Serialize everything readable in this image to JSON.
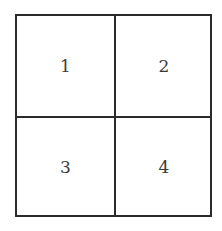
{
  "diagram": {
    "type": "2x2 grid",
    "cells": [
      {
        "label": "1"
      },
      {
        "label": "2"
      },
      {
        "label": "3"
      },
      {
        "label": "4"
      }
    ]
  }
}
